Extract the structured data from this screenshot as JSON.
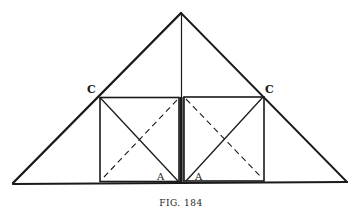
{
  "figure": {
    "caption": "FIG. 184",
    "labels": {
      "c_left": "C",
      "c_right": "C",
      "a_left": "A",
      "a_right": "A"
    },
    "colors": {
      "ink": "#1a1a1a",
      "background": "#ffffff"
    }
  }
}
